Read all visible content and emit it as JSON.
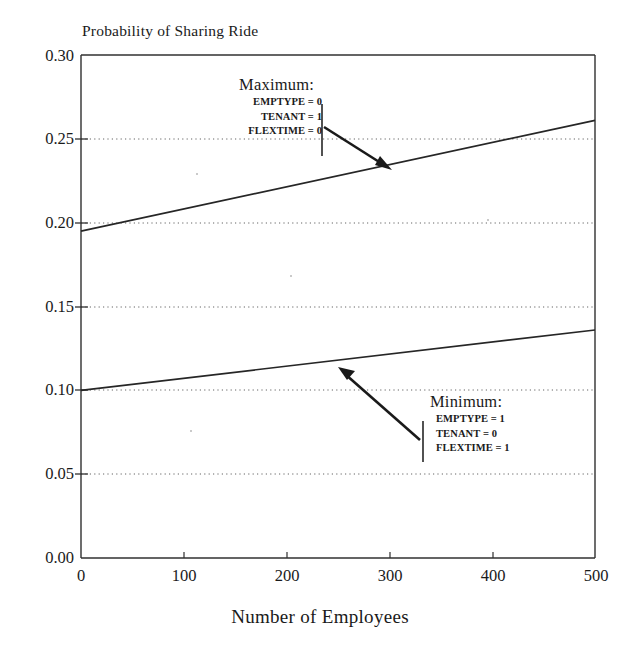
{
  "chart_data": {
    "type": "line",
    "title": "",
    "ylabel": "Probability of Sharing Ride",
    "xlabel": "Number of Employees",
    "xlim": [
      0,
      500
    ],
    "ylim": [
      0.0,
      0.3
    ],
    "xticks": [
      "0",
      "100",
      "200",
      "300",
      "400",
      "500"
    ],
    "xtick_values": [
      0,
      100,
      200,
      300,
      400,
      500
    ],
    "yticks": [
      "0.00",
      "0.05",
      "0.10",
      "0.15",
      "0.20",
      "0.25",
      "0.30"
    ],
    "ytick_values": [
      0.0,
      0.05,
      0.1,
      0.15,
      0.2,
      0.25,
      0.3
    ],
    "grid": "horizontal-dotted",
    "legend": "none",
    "series": [
      {
        "name": "Maximum",
        "x": [
          0,
          500
        ],
        "values": [
          0.195,
          0.261
        ]
      },
      {
        "name": "Minimum",
        "x": [
          0,
          500
        ],
        "values": [
          0.1,
          0.136
        ]
      }
    ],
    "annotations": [
      {
        "id": "maximum",
        "headline": "Maximum:",
        "lines": [
          "EMPTYPE = 0",
          "TENANT = 1",
          "FLEXTIME = 0"
        ],
        "points_to_series": "Maximum",
        "points_to_x": 300,
        "points_to_y": 0.234
      },
      {
        "id": "minimum",
        "headline": "Minimum:",
        "lines": [
          "EMPTYPE = 1",
          "TENANT = 0",
          "FLEXTIME = 1"
        ],
        "points_to_series": "Minimum",
        "points_to_x": 248,
        "points_to_y": 0.118
      }
    ]
  },
  "axes": {
    "y_title": "Probability of Sharing Ride",
    "x_title": "Number of Employees"
  }
}
